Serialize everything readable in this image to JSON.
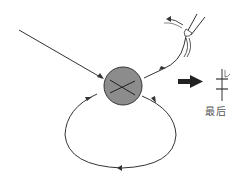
{
  "diagram": {
    "type": "process-flow",
    "nodes": [
      {
        "id": "center-ball",
        "shape": "circle",
        "fill": "#8c8c8c",
        "stroke": "#333333",
        "marking": "crossed-lines"
      },
      {
        "id": "pliers",
        "shape": "tool-icon",
        "description": "tweezer/pliers pulling thread"
      },
      {
        "id": "result-symbol",
        "shape": "vertical-line-with-two-crossbars"
      }
    ],
    "edges": [
      {
        "from": "top-left",
        "to": "center-ball",
        "style": "incoming-arrow"
      },
      {
        "from": "center-ball",
        "to": "pliers",
        "style": "arrow"
      },
      {
        "from": "center-ball",
        "to": "center-ball",
        "style": "loop-arrow",
        "direction": "clockwise"
      }
    ],
    "big_arrow": {
      "color": "#222222",
      "direction": "right"
    },
    "result_label": "最后"
  },
  "colors": {
    "line": "#333333",
    "ball_fill": "#8c8c8c",
    "label": "#555555"
  }
}
